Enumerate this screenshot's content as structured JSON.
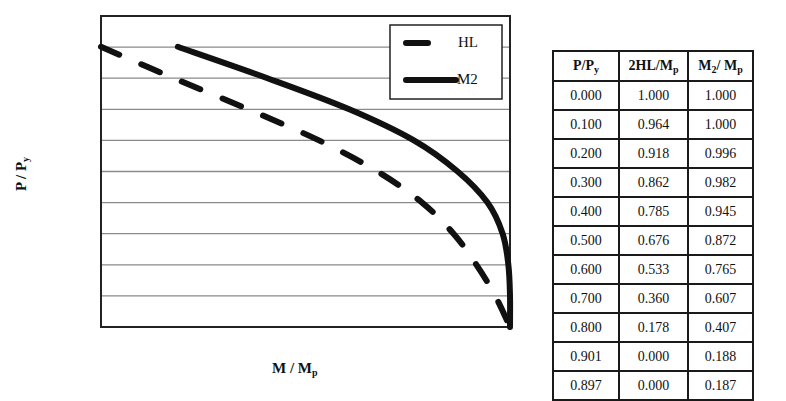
{
  "chart_data": {
    "type": "line",
    "title": "",
    "xlabel": "M / Mp",
    "ylabel": "P / Py",
    "xlabel_parts": {
      "main": "M / M",
      "sub": "p"
    },
    "ylabel_parts": {
      "main": "P / P",
      "sub": "y"
    },
    "xlim": [
      0,
      1.0
    ],
    "ylim": [
      0,
      1.0
    ],
    "grid": true,
    "grid_axis": "y",
    "grid_step": 0.1,
    "tick_labels_shown": false,
    "legend": {
      "placement": "top-right",
      "entries": [
        {
          "name": "HL",
          "style": "dashed"
        },
        {
          "name": "M2",
          "style": "solid"
        }
      ]
    },
    "series": [
      {
        "name": "HL",
        "style": "dashed",
        "points": [
          {
            "P": 0.0,
            "M": 1.0
          },
          {
            "P": 0.1,
            "M": 0.964
          },
          {
            "P": 0.2,
            "M": 0.918
          },
          {
            "P": 0.3,
            "M": 0.862
          },
          {
            "P": 0.4,
            "M": 0.785
          },
          {
            "P": 0.5,
            "M": 0.676
          },
          {
            "P": 0.6,
            "M": 0.533
          },
          {
            "P": 0.7,
            "M": 0.36
          },
          {
            "P": 0.8,
            "M": 0.178
          },
          {
            "P": 0.901,
            "M": 0.0
          }
        ]
      },
      {
        "name": "M2",
        "style": "solid",
        "points": [
          {
            "P": 0.0,
            "M": 1.0
          },
          {
            "P": 0.1,
            "M": 1.0
          },
          {
            "P": 0.2,
            "M": 0.996
          },
          {
            "P": 0.3,
            "M": 0.982
          },
          {
            "P": 0.4,
            "M": 0.945
          },
          {
            "P": 0.5,
            "M": 0.872
          },
          {
            "P": 0.6,
            "M": 0.765
          },
          {
            "P": 0.7,
            "M": 0.607
          },
          {
            "P": 0.8,
            "M": 0.407
          },
          {
            "P": 0.901,
            "M": 0.188
          }
        ]
      }
    ]
  },
  "table": {
    "headers": [
      {
        "main": "P/P",
        "sub": "y",
        "tail": ""
      },
      {
        "main": "2HL/M",
        "sub": "p",
        "tail": ""
      },
      {
        "main": "M",
        "sub": "2",
        "tail": "/ M",
        "sub2": "p"
      }
    ],
    "rows": [
      [
        "0.000",
        "1.000",
        "1.000"
      ],
      [
        "0.100",
        "0.964",
        "1.000"
      ],
      [
        "0.200",
        "0.918",
        "0.996"
      ],
      [
        "0.300",
        "0.862",
        "0.982"
      ],
      [
        "0.400",
        "0.785",
        "0.945"
      ],
      [
        "0.500",
        "0.676",
        "0.872"
      ],
      [
        "0.600",
        "0.533",
        "0.765"
      ],
      [
        "0.700",
        "0.360",
        "0.607"
      ],
      [
        "0.800",
        "0.178",
        "0.407"
      ],
      [
        "0.901",
        "0.000",
        "0.188"
      ],
      [
        "0.897",
        "0.000",
        "0.187"
      ]
    ]
  }
}
